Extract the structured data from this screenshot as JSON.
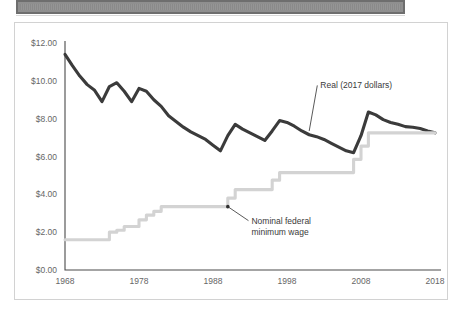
{
  "window": {
    "title_bar_label": "",
    "title_bar_state": "redacted"
  },
  "chart_data": {
    "type": "line",
    "title": "",
    "subtitle": "",
    "xlabel": "",
    "ylabel": "",
    "xlim": [
      1968,
      2018
    ],
    "ylim": [
      0,
      12
    ],
    "grid": false,
    "legend_position": "inline-annotations",
    "y_ticks": [
      0,
      2,
      4,
      6,
      8,
      10,
      12
    ],
    "y_tick_labels": [
      "$0.00",
      "$2.00",
      "$4.00",
      "$6.00",
      "$8.00",
      "$10.00",
      "$12.00"
    ],
    "x_ticks": [
      1968,
      1978,
      1988,
      1998,
      2008,
      2018
    ],
    "x_tick_labels": [
      "1968",
      "1978",
      "1988",
      "1998",
      "2008",
      "2018"
    ],
    "annotations": [
      {
        "name": "real-series-annotation",
        "lines": [
          "Real (2017 dollars)"
        ],
        "text": "Real (2017 dollars)",
        "point_x": 2001,
        "point_y": 7.35,
        "label_x": 2002.5,
        "label_y": 9.6,
        "marker": false
      },
      {
        "name": "nominal-series-annotation",
        "lines": [
          "Nominal federal",
          "minimum wage"
        ],
        "text": "Nominal federal minimum wage",
        "point_x": 1990,
        "point_y": 3.35,
        "label_x": 1993.2,
        "label_y": 2.45,
        "marker": true
      }
    ],
    "series": [
      {
        "name": "Real (2017 dollars)",
        "color": "#3b3b3b",
        "style": "solid",
        "x": [
          1968,
          1969,
          1970,
          1971,
          1972,
          1973,
          1974,
          1975,
          1976,
          1977,
          1978,
          1979,
          1980,
          1981,
          1982,
          1983,
          1984,
          1985,
          1986,
          1987,
          1988,
          1989,
          1990,
          1991,
          1992,
          1993,
          1994,
          1995,
          1996,
          1997,
          1998,
          1999,
          2000,
          2001,
          2002,
          2003,
          2004,
          2005,
          2006,
          2007,
          2008,
          2009,
          2010,
          2011,
          2012,
          2013,
          2014,
          2015,
          2016,
          2017,
          2018
        ],
        "values": [
          11.4,
          10.8,
          10.25,
          9.8,
          9.5,
          8.9,
          9.7,
          9.9,
          9.45,
          8.9,
          9.6,
          9.45,
          9.0,
          8.65,
          8.15,
          7.85,
          7.55,
          7.3,
          7.1,
          6.9,
          6.6,
          6.3,
          7.1,
          7.7,
          7.45,
          7.25,
          7.05,
          6.85,
          7.35,
          7.9,
          7.8,
          7.6,
          7.35,
          7.15,
          7.05,
          6.9,
          6.7,
          6.5,
          6.3,
          6.2,
          7.1,
          8.35,
          8.2,
          7.95,
          7.8,
          7.7,
          7.58,
          7.55,
          7.48,
          7.35,
          7.25
        ],
        "data_label_start": 11.4,
        "data_label_end": 7.25
      },
      {
        "name": "Nominal federal minimum wage",
        "color": "#d3d3d3",
        "style": "step",
        "x": [
          1968,
          1969,
          1970,
          1971,
          1972,
          1973,
          1974,
          1975,
          1976,
          1977,
          1978,
          1979,
          1980,
          1981,
          1982,
          1983,
          1984,
          1985,
          1986,
          1987,
          1988,
          1989,
          1990,
          1991,
          1992,
          1993,
          1994,
          1995,
          1996,
          1997,
          1998,
          1999,
          2000,
          2001,
          2002,
          2003,
          2004,
          2005,
          2006,
          2007,
          2008,
          2009,
          2010,
          2011,
          2012,
          2013,
          2014,
          2015,
          2016,
          2017,
          2018
        ],
        "values": [
          1.6,
          1.6,
          1.6,
          1.6,
          1.6,
          1.6,
          2.0,
          2.1,
          2.3,
          2.3,
          2.65,
          2.9,
          3.1,
          3.35,
          3.35,
          3.35,
          3.35,
          3.35,
          3.35,
          3.35,
          3.35,
          3.35,
          3.8,
          4.25,
          4.25,
          4.25,
          4.25,
          4.25,
          4.75,
          5.15,
          5.15,
          5.15,
          5.15,
          5.15,
          5.15,
          5.15,
          5.15,
          5.15,
          5.15,
          5.85,
          6.55,
          7.25,
          7.25,
          7.25,
          7.25,
          7.25,
          7.25,
          7.25,
          7.25,
          7.25,
          7.25
        ],
        "data_label_start": 1.6,
        "data_label_end": 7.25
      }
    ]
  }
}
